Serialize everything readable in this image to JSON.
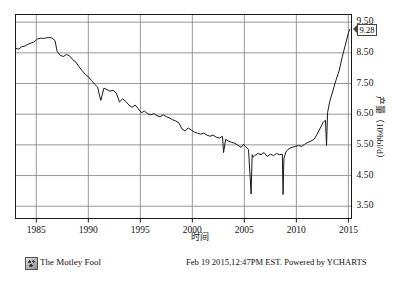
{
  "chart_data": {
    "type": "line",
    "title": "",
    "xlabel": "时间",
    "ylabel": "产量（10⁶bbl/d）",
    "xlim": [
      1983.0,
      2015.3
    ],
    "ylim": [
      3.1,
      9.75
    ],
    "xticks": [
      "1985",
      "1990",
      "1995",
      "2000",
      "2005",
      "2010",
      "2015"
    ],
    "xtick_values": [
      1985,
      1990,
      1995,
      2000,
      2005,
      2010,
      2015
    ],
    "yticks": [
      "9.50",
      "8.50",
      "7.50",
      "6.50",
      "5.50",
      "4.50",
      "3.50"
    ],
    "ytick_values": [
      9.5,
      8.5,
      7.5,
      6.5,
      5.5,
      4.5,
      3.5
    ],
    "grid": true,
    "legend": "none",
    "last_value_label": "9.28",
    "series": [
      {
        "name": "US Crude Oil Production",
        "color": "#1a1a1a",
        "x": [
          1983.0,
          1983.3,
          1983.6,
          1983.9,
          1984.2,
          1984.5,
          1984.8,
          1985.1,
          1985.4,
          1985.7,
          1986.0,
          1986.3,
          1986.5,
          1986.8,
          1987.0,
          1987.3,
          1987.6,
          1987.9,
          1988.2,
          1988.5,
          1988.8,
          1989.1,
          1989.4,
          1989.7,
          1990.0,
          1990.3,
          1990.6,
          1990.9,
          1991.0,
          1991.2,
          1991.5,
          1991.8,
          1992.1,
          1992.4,
          1992.7,
          1993.0,
          1993.3,
          1993.6,
          1993.9,
          1994.2,
          1994.5,
          1994.8,
          1995.1,
          1995.4,
          1995.7,
          1996.0,
          1996.3,
          1996.6,
          1996.9,
          1997.2,
          1997.5,
          1997.8,
          1998.1,
          1998.4,
          1998.7,
          1999.0,
          1999.3,
          1999.6,
          1999.9,
          2000.2,
          2000.5,
          2000.8,
          2001.1,
          2001.4,
          2001.7,
          2002.0,
          2002.3,
          2002.6,
          2002.9,
          2003.0,
          2003.2,
          2003.5,
          2003.8,
          2004.1,
          2004.4,
          2004.7,
          2004.9,
          2005.1,
          2005.4,
          2005.65,
          2005.75,
          2005.85,
          2006.0,
          2006.3,
          2006.6,
          2006.9,
          2007.2,
          2007.5,
          2007.8,
          2008.1,
          2008.4,
          2008.65,
          2008.72,
          2008.8,
          2009.0,
          2009.3,
          2009.6,
          2009.9,
          2010.2,
          2010.5,
          2010.8,
          2011.1,
          2011.4,
          2011.7,
          2012.0,
          2012.3,
          2012.6,
          2012.8,
          2012.9,
          2013.0,
          2013.2,
          2013.5,
          2013.8,
          2014.1,
          2014.4,
          2014.7,
          2015.0,
          2015.15
        ],
        "y": [
          8.65,
          8.62,
          8.7,
          8.72,
          8.78,
          8.82,
          8.86,
          8.95,
          8.98,
          8.97,
          8.99,
          9.0,
          8.98,
          8.9,
          8.55,
          8.42,
          8.38,
          8.45,
          8.4,
          8.28,
          8.2,
          8.05,
          7.92,
          7.8,
          7.72,
          7.6,
          7.48,
          7.38,
          7.22,
          6.95,
          7.35,
          7.3,
          7.25,
          7.28,
          7.18,
          6.9,
          7.0,
          6.92,
          6.8,
          6.72,
          6.8,
          6.68,
          6.55,
          6.6,
          6.52,
          6.48,
          6.52,
          6.45,
          6.42,
          6.48,
          6.42,
          6.38,
          6.32,
          6.28,
          6.22,
          6.02,
          5.95,
          6.05,
          5.98,
          5.92,
          5.88,
          5.85,
          5.88,
          5.82,
          5.78,
          5.82,
          5.75,
          5.72,
          5.78,
          5.25,
          5.68,
          5.62,
          5.58,
          5.55,
          5.48,
          5.42,
          5.52,
          5.45,
          5.35,
          3.9,
          5.18,
          5.1,
          5.15,
          5.22,
          5.18,
          5.25,
          5.12,
          5.2,
          5.15,
          5.22,
          5.18,
          5.2,
          3.88,
          5.05,
          5.28,
          5.38,
          5.42,
          5.45,
          5.48,
          5.45,
          5.52,
          5.58,
          5.62,
          5.68,
          5.85,
          6.05,
          6.25,
          6.3,
          5.48,
          6.55,
          6.9,
          7.25,
          7.6,
          7.9,
          8.35,
          8.75,
          9.15,
          9.28
        ]
      }
    ]
  },
  "annotations": {
    "last_value": "9.28"
  },
  "footer": {
    "brand": "The Motley Fool",
    "logo_name": "motley-fool-logo",
    "credit": "Feb 19 2015,12:47PM EST. Powered by YCHARTS"
  },
  "colors": {
    "line": "#1a1a1a",
    "grid": "#8c8c8c",
    "frame": "#1a1a1a",
    "background": "#ffffff"
  }
}
